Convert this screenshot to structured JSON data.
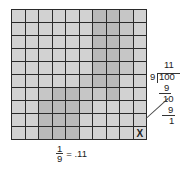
{
  "grid": {
    "rows": 10,
    "cols": 10,
    "marked_cell": {
      "row": 9,
      "col": 9,
      "label": "X"
    },
    "shading": [
      [
        0,
        0,
        0,
        0,
        0,
        0,
        2,
        2,
        1,
        0
      ],
      [
        0,
        0,
        0,
        0,
        0,
        0,
        2,
        2,
        1,
        0
      ],
      [
        0,
        0,
        0,
        0,
        0,
        0,
        2,
        2,
        1,
        0
      ],
      [
        0,
        0,
        0,
        0,
        0,
        0,
        2,
        2,
        1,
        0
      ],
      [
        0,
        0,
        0,
        0,
        0,
        0,
        2,
        2,
        1,
        0
      ],
      [
        0,
        0,
        0,
        0,
        0,
        1,
        2,
        2,
        0,
        0
      ],
      [
        0,
        0,
        1,
        2,
        2,
        1,
        1,
        2,
        0,
        0
      ],
      [
        0,
        0,
        2,
        2,
        2,
        1,
        0,
        0,
        0,
        0
      ],
      [
        0,
        0,
        2,
        2,
        2,
        0,
        0,
        0,
        0,
        0
      ],
      [
        0,
        0,
        2,
        2,
        2,
        0,
        0,
        0,
        0,
        -1
      ]
    ]
  },
  "division": {
    "quotient": "11",
    "divisor": "9",
    "dividend": "100",
    "step1_subtract": "9",
    "step1_remainder": "10",
    "step2_subtract": "9",
    "remainder": "1"
  },
  "caption": {
    "numerator": "1",
    "denominator": "9",
    "equals": "= .11"
  }
}
